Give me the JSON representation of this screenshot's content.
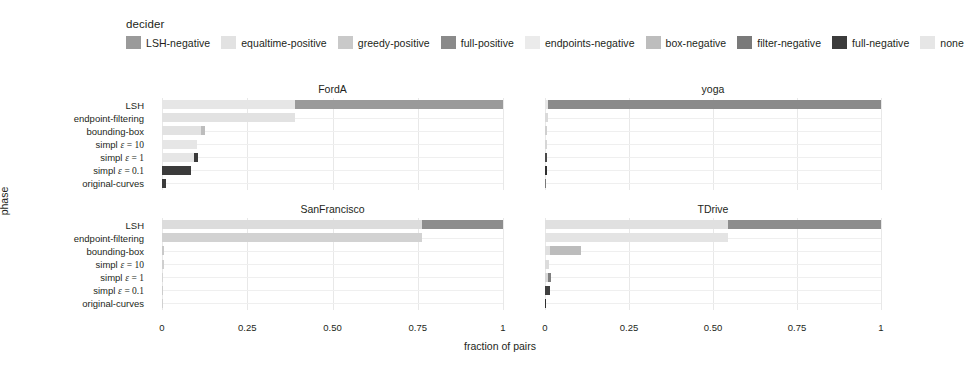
{
  "legend": {
    "title": "decider",
    "entries": [
      {
        "label": "LSH-negative",
        "color": "#9a9a9a"
      },
      {
        "label": "equaltime-positive",
        "color": "#e2e2e2"
      },
      {
        "label": "greedy-positive",
        "color": "#c9c9c9"
      },
      {
        "label": "full-positive",
        "color": "#8a8a8a"
      },
      {
        "label": "endpoints-negative",
        "color": "#ebebeb"
      },
      {
        "label": "box-negative",
        "color": "#bdbdbd"
      },
      {
        "label": "filter-negative",
        "color": "#7a7a7a"
      },
      {
        "label": "full-negative",
        "color": "#3b3b3b"
      },
      {
        "label": "none",
        "color": "#e6e6e6"
      }
    ]
  },
  "axes": {
    "xlabel": "fraction of pairs",
    "ylabel": "phase",
    "xticks": [
      "0",
      "0.25",
      "0.50",
      "0.75",
      "1"
    ],
    "xtick_values": [
      0,
      0.25,
      0.5,
      0.75,
      1
    ],
    "xlim": [
      0,
      1
    ],
    "yticks": [
      "LSH",
      "endpoint-filtering",
      "bounding-box",
      "simpl ε = 10",
      "simpl ε = 1",
      "simpl ε = 0.1",
      "original-curves"
    ]
  },
  "chart_data": {
    "type": "bar",
    "orientation": "horizontal",
    "stacked": true,
    "title": "",
    "xlabel": "fraction of pairs",
    "ylabel": "phase",
    "xlim": [
      0,
      1
    ],
    "grid": true,
    "legend_position": "top",
    "legend_title": "decider",
    "categories": [
      "LSH",
      "endpoint-filtering",
      "bounding-box",
      "simpl ε = 10",
      "simpl ε = 1",
      "simpl ε = 0.1",
      "original-curves"
    ],
    "series_names": [
      "LSH-negative",
      "equaltime-positive",
      "greedy-positive",
      "full-positive",
      "endpoints-negative",
      "box-negative",
      "filter-negative",
      "full-negative",
      "none"
    ],
    "panels": [
      {
        "name": "FordA",
        "rows": [
          {
            "category": "LSH",
            "segments": [
              {
                "decider": "none",
                "start": 0.0,
                "end": 0.39,
                "color": "#e6e6e6"
              },
              {
                "decider": "LSH-negative",
                "start": 0.39,
                "end": 1.0,
                "color": "#9a9a9a"
              }
            ]
          },
          {
            "category": "endpoint-filtering",
            "segments": [
              {
                "decider": "none",
                "start": 0.0,
                "end": 0.39,
                "color": "#e2e2e2"
              }
            ]
          },
          {
            "category": "bounding-box",
            "segments": [
              {
                "decider": "none",
                "start": 0.0,
                "end": 0.113,
                "color": "#e2e2e2"
              },
              {
                "decider": "box-negative",
                "start": 0.113,
                "end": 0.125,
                "color": "#bdbdbd"
              }
            ]
          },
          {
            "category": "simpl ε = 10",
            "segments": [
              {
                "decider": "none",
                "start": 0.0,
                "end": 0.103,
                "color": "#e6e6e6"
              }
            ]
          },
          {
            "category": "simpl ε = 1",
            "segments": [
              {
                "decider": "none",
                "start": 0.0,
                "end": 0.095,
                "color": "#e6e6e6"
              },
              {
                "decider": "full-negative",
                "start": 0.095,
                "end": 0.105,
                "color": "#3b3b3b"
              }
            ]
          },
          {
            "category": "simpl ε = 0.1",
            "segments": [
              {
                "decider": "full-negative",
                "start": 0.0,
                "end": 0.085,
                "color": "#3b3b3b"
              }
            ]
          },
          {
            "category": "original-curves",
            "segments": [
              {
                "decider": "full-negative",
                "start": 0.0,
                "end": 0.013,
                "color": "#3b3b3b"
              }
            ]
          }
        ]
      },
      {
        "name": "yoga",
        "rows": [
          {
            "category": "LSH",
            "segments": [
              {
                "decider": "none",
                "start": 0.0,
                "end": 0.008,
                "color": "#e6e6e6"
              },
              {
                "decider": "LSH-negative",
                "start": 0.008,
                "end": 1.0,
                "color": "#8a8a8a"
              }
            ]
          },
          {
            "category": "endpoint-filtering",
            "segments": [
              {
                "decider": "none",
                "start": 0.0,
                "end": 0.008,
                "color": "#dadada"
              }
            ]
          },
          {
            "category": "bounding-box",
            "segments": [
              {
                "decider": "none",
                "start": 0.0,
                "end": 0.007,
                "color": "#cfcfcf"
              }
            ]
          },
          {
            "category": "simpl ε = 10",
            "segments": [
              {
                "decider": "none",
                "start": 0.0,
                "end": 0.007,
                "color": "#d6d6d6"
              }
            ]
          },
          {
            "category": "simpl ε = 1",
            "segments": [
              {
                "decider": "full-negative",
                "start": 0.0,
                "end": 0.006,
                "color": "#4a4a4a"
              }
            ]
          },
          {
            "category": "simpl ε = 0.1",
            "segments": [
              {
                "decider": "full-negative",
                "start": 0.0,
                "end": 0.006,
                "color": "#2e2e2e"
              }
            ]
          },
          {
            "category": "original-curves",
            "segments": [
              {
                "decider": "full-negative",
                "start": 0.0,
                "end": 0.004,
                "color": "#7a7a7a"
              }
            ]
          }
        ]
      },
      {
        "name": "SanFrancisco",
        "rows": [
          {
            "category": "LSH",
            "segments": [
              {
                "decider": "none",
                "start": 0.0,
                "end": 0.763,
                "color": "#dcdcdc"
              },
              {
                "decider": "LSH-negative",
                "start": 0.763,
                "end": 1.0,
                "color": "#8d8d8d"
              }
            ]
          },
          {
            "category": "endpoint-filtering",
            "segments": [
              {
                "decider": "none",
                "start": 0.0,
                "end": 0.763,
                "color": "#d2d2d2"
              }
            ]
          },
          {
            "category": "bounding-box",
            "segments": [
              {
                "decider": "none",
                "start": 0.0,
                "end": 0.005,
                "color": "#c9c9c9"
              }
            ]
          },
          {
            "category": "simpl ε = 10",
            "segments": [
              {
                "decider": "none",
                "start": 0.0,
                "end": 0.005,
                "color": "#cfcfcf"
              }
            ]
          },
          {
            "category": "simpl ε = 1",
            "segments": [
              {
                "decider": "none",
                "start": 0.0,
                "end": 0.004,
                "color": "#d4d4d4"
              }
            ]
          },
          {
            "category": "simpl ε = 0.1",
            "segments": [
              {
                "decider": "none",
                "start": 0.0,
                "end": 0.004,
                "color": "#cccccc"
              }
            ]
          },
          {
            "category": "original-curves",
            "segments": [
              {
                "decider": "none",
                "start": 0.0,
                "end": 0.003,
                "color": "#d0d0d0"
              }
            ]
          }
        ]
      },
      {
        "name": "TDrive",
        "rows": [
          {
            "category": "LSH",
            "segments": [
              {
                "decider": "none",
                "start": 0.0,
                "end": 0.545,
                "color": "#e0e0e0"
              },
              {
                "decider": "LSH-negative",
                "start": 0.545,
                "end": 1.0,
                "color": "#8d8d8d"
              }
            ]
          },
          {
            "category": "endpoint-filtering",
            "segments": [
              {
                "decider": "none",
                "start": 0.0,
                "end": 0.545,
                "color": "#e4e4e4"
              }
            ]
          },
          {
            "category": "bounding-box",
            "segments": [
              {
                "decider": "none",
                "start": 0.0,
                "end": 0.016,
                "color": "#e0e0e0"
              },
              {
                "decider": "box-negative",
                "start": 0.016,
                "end": 0.108,
                "color": "#bcbcbc"
              }
            ]
          },
          {
            "category": "simpl ε = 10",
            "segments": [
              {
                "decider": "none",
                "start": 0.0,
                "end": 0.013,
                "color": "#dcdcdc"
              }
            ]
          },
          {
            "category": "simpl ε = 1",
            "segments": [
              {
                "decider": "none",
                "start": 0.0,
                "end": 0.009,
                "color": "#d8d8d8"
              },
              {
                "decider": "filter-negative",
                "start": 0.009,
                "end": 0.018,
                "color": "#7f7f7f"
              }
            ]
          },
          {
            "category": "simpl ε = 0.1",
            "segments": [
              {
                "decider": "full-negative",
                "start": 0.0,
                "end": 0.016,
                "color": "#3f3f3f"
              }
            ]
          },
          {
            "category": "original-curves",
            "segments": [
              {
                "decider": "full-negative",
                "start": 0.0,
                "end": 0.004,
                "color": "#2f2f2f"
              }
            ]
          }
        ]
      }
    ]
  }
}
